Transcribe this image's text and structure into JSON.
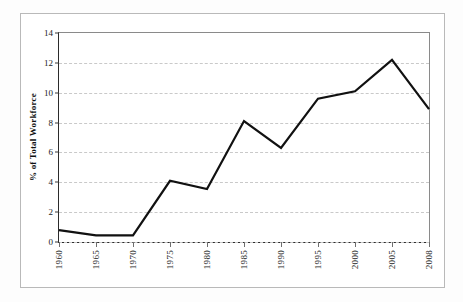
{
  "figure": {
    "background_color": "#ffffff",
    "frame_color": "#b9b9b9",
    "axis_color": "#2b2b2b",
    "grid_color": "#c9c9c9",
    "series_color": "#111111"
  },
  "chart_data": {
    "type": "line",
    "title": "",
    "xlabel": "",
    "ylabel": "% of Total Workforce",
    "categories": [
      "1960",
      "1965",
      "1970",
      "1975",
      "1980",
      "1985",
      "1990",
      "1995",
      "2000",
      "2005",
      "2008"
    ],
    "values": [
      0.8,
      0.45,
      0.45,
      4.1,
      3.55,
      8.1,
      6.3,
      9.6,
      10.1,
      12.2,
      8.9
    ],
    "series": [
      {
        "name": "% of Total Workforce",
        "values": [
          0.8,
          0.45,
          0.45,
          4.1,
          3.55,
          8.1,
          6.3,
          9.6,
          10.1,
          12.2,
          8.9
        ]
      }
    ],
    "ylim": [
      0,
      14
    ],
    "yticks": [
      0,
      2,
      4,
      6,
      8,
      10,
      12,
      14
    ],
    "ytick_labels": [
      "0",
      "2",
      "4",
      "6",
      "8",
      "10",
      "12",
      "14"
    ],
    "grid": "horizontal-dashed",
    "legend": "none",
    "line_width": 2.2,
    "markers": "none"
  }
}
